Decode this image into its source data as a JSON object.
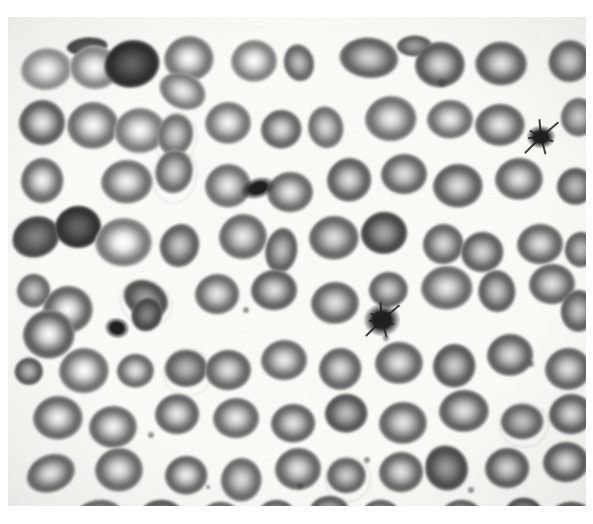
{
  "image": {
    "kind": "photomicrograph",
    "subject": "peripheral blood smear",
    "modality": "brightfield light microscopy",
    "color_mode": "grayscale",
    "width_px": 593,
    "height_px": 524,
    "background_color": "#f6f6f3",
    "paper_margin_color": "#ffffff",
    "cell_ring_color": "#5d5d5d",
    "cell_dark_color": "#2c2c2c",
    "cell_pallor_color": "#efefec",
    "platelet_color": "#262626"
  },
  "field": {
    "left": 8,
    "top": 17,
    "width": 578,
    "height": 489
  },
  "objects": {
    "erythrocytes": [
      {
        "x": 12,
        "y": 30,
        "w": 58,
        "h": 52,
        "rot": -6,
        "tone": 0.58,
        "pallor": 0.62,
        "shape": "discocyte"
      },
      {
        "x": 58,
        "y": 20,
        "w": 46,
        "h": 22,
        "rot": -4,
        "tone": 0.3,
        "pallor": 0.1,
        "shape": "edge-clip"
      },
      {
        "x": 60,
        "y": 28,
        "w": 56,
        "h": 54,
        "rot": 8,
        "tone": 0.55,
        "pallor": 0.66,
        "shape": "discocyte"
      },
      {
        "x": 96,
        "y": 22,
        "w": 62,
        "h": 58,
        "rot": -10,
        "tone": 0.2,
        "pallor": 0.3,
        "shape": "dense"
      },
      {
        "x": 155,
        "y": 18,
        "w": 56,
        "h": 56,
        "rot": 0,
        "tone": 0.48,
        "pallor": 0.74,
        "shape": "discocyte"
      },
      {
        "x": 148,
        "y": 56,
        "w": 54,
        "h": 44,
        "rot": 24,
        "tone": 0.5,
        "pallor": 0.62,
        "shape": "ovalocyte"
      },
      {
        "x": 222,
        "y": 22,
        "w": 52,
        "h": 52,
        "rot": 0,
        "tone": 0.52,
        "pallor": 0.7,
        "shape": "discocyte"
      },
      {
        "x": 276,
        "y": 26,
        "w": 34,
        "h": 46,
        "rot": -14,
        "tone": 0.42,
        "pallor": 0.5,
        "shape": "edge-clip"
      },
      {
        "x": 330,
        "y": 20,
        "w": 66,
        "h": 50,
        "rot": 6,
        "tone": 0.4,
        "pallor": 0.64,
        "shape": "discocyte"
      },
      {
        "x": 388,
        "y": 18,
        "w": 40,
        "h": 26,
        "rot": 0,
        "tone": 0.4,
        "pallor": 0.35,
        "shape": "edge-clip"
      },
      {
        "x": 406,
        "y": 24,
        "w": 56,
        "h": 56,
        "rot": 0,
        "tone": 0.38,
        "pallor": 0.72,
        "shape": "discocyte"
      },
      {
        "x": 466,
        "y": 24,
        "w": 58,
        "h": 54,
        "rot": 4,
        "tone": 0.4,
        "pallor": 0.74,
        "shape": "discocyte"
      },
      {
        "x": 540,
        "y": 22,
        "w": 48,
        "h": 52,
        "rot": -8,
        "tone": 0.42,
        "pallor": 0.6,
        "shape": "discocyte"
      },
      {
        "x": 10,
        "y": 82,
        "w": 52,
        "h": 56,
        "rot": 0,
        "tone": 0.4,
        "pallor": 0.78,
        "shape": "discocyte"
      },
      {
        "x": 58,
        "y": 84,
        "w": 58,
        "h": 58,
        "rot": 0,
        "tone": 0.46,
        "pallor": 0.76,
        "shape": "discocyte"
      },
      {
        "x": 105,
        "y": 90,
        "w": 58,
        "h": 56,
        "rot": 0,
        "tone": 0.5,
        "pallor": 0.7,
        "shape": "discocyte"
      },
      {
        "x": 148,
        "y": 96,
        "w": 40,
        "h": 52,
        "rot": 12,
        "tone": 0.46,
        "pallor": 0.52,
        "shape": "echinocyte"
      },
      {
        "x": 196,
        "y": 84,
        "w": 52,
        "h": 52,
        "rot": 0,
        "tone": 0.48,
        "pallor": 0.7,
        "shape": "discocyte"
      },
      {
        "x": 252,
        "y": 92,
        "w": 46,
        "h": 48,
        "rot": 0,
        "tone": 0.42,
        "pallor": 0.66,
        "shape": "discocyte"
      },
      {
        "x": 300,
        "y": 88,
        "w": 40,
        "h": 52,
        "rot": -12,
        "tone": 0.46,
        "pallor": 0.58,
        "shape": "ovalocyte"
      },
      {
        "x": 356,
        "y": 78,
        "w": 58,
        "h": 56,
        "rot": 0,
        "tone": 0.46,
        "pallor": 0.7,
        "shape": "discocyte"
      },
      {
        "x": 418,
        "y": 82,
        "w": 52,
        "h": 48,
        "rot": 0,
        "tone": 0.46,
        "pallor": 0.68,
        "shape": "discocyte"
      },
      {
        "x": 466,
        "y": 86,
        "w": 56,
        "h": 52,
        "rot": 0,
        "tone": 0.42,
        "pallor": 0.72,
        "shape": "discocyte"
      },
      {
        "x": 552,
        "y": 80,
        "w": 40,
        "h": 48,
        "rot": 0,
        "tone": 0.46,
        "pallor": 0.5,
        "shape": "edge-clip"
      },
      {
        "x": 12,
        "y": 140,
        "w": 48,
        "h": 56,
        "rot": 0,
        "tone": 0.44,
        "pallor": 0.76,
        "shape": "discocyte"
      },
      {
        "x": 92,
        "y": 142,
        "w": 58,
        "h": 54,
        "rot": 0,
        "tone": 0.46,
        "pallor": 0.72,
        "shape": "discocyte"
      },
      {
        "x": 146,
        "y": 132,
        "w": 42,
        "h": 54,
        "rot": 10,
        "tone": 0.44,
        "pallor": 0.56,
        "shape": "echinocyte"
      },
      {
        "x": 196,
        "y": 146,
        "w": 52,
        "h": 54,
        "rot": 0,
        "tone": 0.46,
        "pallor": 0.68,
        "shape": "discocyte"
      },
      {
        "x": 258,
        "y": 154,
        "w": 52,
        "h": 50,
        "rot": 0,
        "tone": 0.44,
        "pallor": 0.7,
        "shape": "discocyte"
      },
      {
        "x": 318,
        "y": 140,
        "w": 50,
        "h": 54,
        "rot": 0,
        "tone": 0.4,
        "pallor": 0.7,
        "shape": "discocyte"
      },
      {
        "x": 372,
        "y": 136,
        "w": 52,
        "h": 50,
        "rot": 0,
        "tone": 0.42,
        "pallor": 0.66,
        "shape": "discocyte"
      },
      {
        "x": 424,
        "y": 146,
        "w": 56,
        "h": 54,
        "rot": 0,
        "tone": 0.4,
        "pallor": 0.7,
        "shape": "discocyte"
      },
      {
        "x": 486,
        "y": 140,
        "w": 54,
        "h": 52,
        "rot": 0,
        "tone": 0.42,
        "pallor": 0.7,
        "shape": "discocyte"
      },
      {
        "x": 548,
        "y": 150,
        "w": 42,
        "h": 46,
        "rot": 0,
        "tone": 0.4,
        "pallor": 0.52,
        "shape": "edge-clip"
      },
      {
        "x": 4,
        "y": 198,
        "w": 54,
        "h": 50,
        "rot": -18,
        "tone": 0.3,
        "pallor": 0.32,
        "shape": "dense"
      },
      {
        "x": 46,
        "y": 188,
        "w": 52,
        "h": 52,
        "rot": 0,
        "tone": 0.22,
        "pallor": 0.28,
        "shape": "dense"
      },
      {
        "x": 86,
        "y": 200,
        "w": 64,
        "h": 60,
        "rot": 0,
        "tone": 0.5,
        "pallor": 0.82,
        "shape": "discocyte"
      },
      {
        "x": 150,
        "y": 206,
        "w": 44,
        "h": 54,
        "rot": 16,
        "tone": 0.4,
        "pallor": 0.58,
        "shape": "ovalocyte"
      },
      {
        "x": 210,
        "y": 196,
        "w": 54,
        "h": 56,
        "rot": 0,
        "tone": 0.44,
        "pallor": 0.7,
        "shape": "discocyte"
      },
      {
        "x": 256,
        "y": 210,
        "w": 36,
        "h": 56,
        "rot": 8,
        "tone": 0.4,
        "pallor": 0.52,
        "shape": "ovalocyte"
      },
      {
        "x": 300,
        "y": 198,
        "w": 56,
        "h": 54,
        "rot": 0,
        "tone": 0.42,
        "pallor": 0.66,
        "shape": "discocyte"
      },
      {
        "x": 352,
        "y": 194,
        "w": 52,
        "h": 52,
        "rot": 0,
        "tone": 0.3,
        "pallor": 0.52,
        "shape": "dense"
      },
      {
        "x": 414,
        "y": 206,
        "w": 46,
        "h": 50,
        "rot": 0,
        "tone": 0.42,
        "pallor": 0.62,
        "shape": "discocyte"
      },
      {
        "x": 452,
        "y": 214,
        "w": 48,
        "h": 50,
        "rot": 0,
        "tone": 0.4,
        "pallor": 0.64,
        "shape": "discocyte"
      },
      {
        "x": 508,
        "y": 206,
        "w": 52,
        "h": 50,
        "rot": 0,
        "tone": 0.42,
        "pallor": 0.68,
        "shape": "discocyte"
      },
      {
        "x": 556,
        "y": 214,
        "w": 36,
        "h": 44,
        "rot": 0,
        "tone": 0.42,
        "pallor": 0.5,
        "shape": "edge-clip"
      },
      {
        "x": 8,
        "y": 256,
        "w": 38,
        "h": 42,
        "rot": 0,
        "tone": 0.44,
        "pallor": 0.48,
        "shape": "edge-clip"
      },
      {
        "x": 34,
        "y": 268,
        "w": 56,
        "h": 58,
        "rot": 0,
        "tone": 0.42,
        "pallor": 0.82,
        "shape": "discocyte"
      },
      {
        "x": 112,
        "y": 264,
        "w": 52,
        "h": 44,
        "rot": 28,
        "tone": 0.34,
        "pallor": 0.46,
        "shape": "echinocyte"
      },
      {
        "x": 122,
        "y": 280,
        "w": 34,
        "h": 42,
        "rot": 20,
        "tone": 0.3,
        "pallor": 0.34,
        "shape": "dense"
      },
      {
        "x": 186,
        "y": 256,
        "w": 50,
        "h": 50,
        "rot": 0,
        "tone": 0.44,
        "pallor": 0.68,
        "shape": "discocyte"
      },
      {
        "x": 242,
        "y": 252,
        "w": 52,
        "h": 50,
        "rot": 0,
        "tone": 0.4,
        "pallor": 0.7,
        "shape": "discocyte"
      },
      {
        "x": 302,
        "y": 264,
        "w": 54,
        "h": 52,
        "rot": 0,
        "tone": 0.42,
        "pallor": 0.68,
        "shape": "discocyte"
      },
      {
        "x": 360,
        "y": 254,
        "w": 44,
        "h": 44,
        "rot": 0,
        "tone": 0.42,
        "pallor": 0.58,
        "shape": "discocyte"
      },
      {
        "x": 412,
        "y": 248,
        "w": 58,
        "h": 54,
        "rot": 0,
        "tone": 0.44,
        "pallor": 0.7,
        "shape": "discocyte"
      },
      {
        "x": 470,
        "y": 252,
        "w": 42,
        "h": 52,
        "rot": -8,
        "tone": 0.4,
        "pallor": 0.58,
        "shape": "ovalocyte"
      },
      {
        "x": 520,
        "y": 246,
        "w": 52,
        "h": 50,
        "rot": 0,
        "tone": 0.42,
        "pallor": 0.68,
        "shape": "discocyte"
      },
      {
        "x": 552,
        "y": 272,
        "w": 40,
        "h": 52,
        "rot": 0,
        "tone": 0.4,
        "pallor": 0.56,
        "shape": "edge-clip"
      },
      {
        "x": 14,
        "y": 292,
        "w": 58,
        "h": 60,
        "rot": 0,
        "tone": 0.4,
        "pallor": 0.86,
        "shape": "discocyte"
      },
      {
        "x": 6,
        "y": 340,
        "w": 32,
        "h": 34,
        "rot": 0,
        "tone": 0.38,
        "pallor": 0.52,
        "shape": "edge-clip"
      },
      {
        "x": 50,
        "y": 330,
        "w": 56,
        "h": 56,
        "rot": 0,
        "tone": 0.46,
        "pallor": 0.8,
        "shape": "discocyte"
      },
      {
        "x": 108,
        "y": 336,
        "w": 42,
        "h": 42,
        "rot": 0,
        "tone": 0.44,
        "pallor": 0.66,
        "shape": "discocyte"
      },
      {
        "x": 156,
        "y": 332,
        "w": 48,
        "h": 46,
        "rot": 0,
        "tone": 0.4,
        "pallor": 0.48,
        "shape": "echinocyte"
      },
      {
        "x": 196,
        "y": 332,
        "w": 52,
        "h": 50,
        "rot": 0,
        "tone": 0.42,
        "pallor": 0.68,
        "shape": "discocyte"
      },
      {
        "x": 252,
        "y": 322,
        "w": 52,
        "h": 50,
        "rot": 0,
        "tone": 0.44,
        "pallor": 0.7,
        "shape": "discocyte"
      },
      {
        "x": 310,
        "y": 330,
        "w": 48,
        "h": 52,
        "rot": 0,
        "tone": 0.42,
        "pallor": 0.66,
        "shape": "discocyte"
      },
      {
        "x": 366,
        "y": 324,
        "w": 54,
        "h": 52,
        "rot": 0,
        "tone": 0.42,
        "pallor": 0.7,
        "shape": "discocyte"
      },
      {
        "x": 424,
        "y": 326,
        "w": 48,
        "h": 54,
        "rot": 0,
        "tone": 0.38,
        "pallor": 0.62,
        "shape": "ovalocyte"
      },
      {
        "x": 478,
        "y": 316,
        "w": 52,
        "h": 52,
        "rot": 0,
        "tone": 0.4,
        "pallor": 0.68,
        "shape": "discocyte"
      },
      {
        "x": 536,
        "y": 330,
        "w": 52,
        "h": 52,
        "rot": 0,
        "tone": 0.42,
        "pallor": 0.7,
        "shape": "discocyte"
      },
      {
        "x": 24,
        "y": 378,
        "w": 56,
        "h": 54,
        "rot": 0,
        "tone": 0.44,
        "pallor": 0.78,
        "shape": "discocyte"
      },
      {
        "x": 80,
        "y": 388,
        "w": 54,
        "h": 52,
        "rot": 0,
        "tone": 0.44,
        "pallor": 0.76,
        "shape": "discocyte"
      },
      {
        "x": 146,
        "y": 376,
        "w": 50,
        "h": 50,
        "rot": 0,
        "tone": 0.42,
        "pallor": 0.72,
        "shape": "discocyte"
      },
      {
        "x": 204,
        "y": 380,
        "w": 52,
        "h": 50,
        "rot": 0,
        "tone": 0.44,
        "pallor": 0.7,
        "shape": "discocyte"
      },
      {
        "x": 262,
        "y": 386,
        "w": 50,
        "h": 48,
        "rot": 0,
        "tone": 0.42,
        "pallor": 0.68,
        "shape": "discocyte"
      },
      {
        "x": 316,
        "y": 376,
        "w": 48,
        "h": 48,
        "rot": 0,
        "tone": 0.36,
        "pallor": 0.56,
        "shape": "discocyte"
      },
      {
        "x": 370,
        "y": 384,
        "w": 54,
        "h": 52,
        "rot": 0,
        "tone": 0.42,
        "pallor": 0.7,
        "shape": "discocyte"
      },
      {
        "x": 430,
        "y": 372,
        "w": 56,
        "h": 52,
        "rot": 0,
        "tone": 0.4,
        "pallor": 0.72,
        "shape": "discocyte"
      },
      {
        "x": 492,
        "y": 386,
        "w": 48,
        "h": 44,
        "rot": 0,
        "tone": 0.42,
        "pallor": 0.52,
        "shape": "echinocyte"
      },
      {
        "x": 540,
        "y": 376,
        "w": 50,
        "h": 50,
        "rot": 0,
        "tone": 0.4,
        "pallor": 0.7,
        "shape": "discocyte"
      },
      {
        "x": 18,
        "y": 436,
        "w": 56,
        "h": 46,
        "rot": -20,
        "tone": 0.44,
        "pallor": 0.72,
        "shape": "ovalocyte"
      },
      {
        "x": 86,
        "y": 430,
        "w": 54,
        "h": 54,
        "rot": 0,
        "tone": 0.44,
        "pallor": 0.74,
        "shape": "discocyte"
      },
      {
        "x": 156,
        "y": 438,
        "w": 48,
        "h": 48,
        "rot": 0,
        "tone": 0.42,
        "pallor": 0.76,
        "shape": "discocyte"
      },
      {
        "x": 212,
        "y": 440,
        "w": 46,
        "h": 54,
        "rot": 0,
        "tone": 0.44,
        "pallor": 0.62,
        "shape": "discocyte"
      },
      {
        "x": 266,
        "y": 430,
        "w": 52,
        "h": 52,
        "rot": 0,
        "tone": 0.42,
        "pallor": 0.7,
        "shape": "discocyte"
      },
      {
        "x": 318,
        "y": 440,
        "w": 44,
        "h": 44,
        "rot": 0,
        "tone": 0.42,
        "pallor": 0.56,
        "shape": "echinocyte"
      },
      {
        "x": 370,
        "y": 434,
        "w": 50,
        "h": 50,
        "rot": 0,
        "tone": 0.42,
        "pallor": 0.7,
        "shape": "discocyte"
      },
      {
        "x": 418,
        "y": 426,
        "w": 48,
        "h": 56,
        "rot": -28,
        "tone": 0.32,
        "pallor": 0.44,
        "shape": "ovalocyte"
      },
      {
        "x": 476,
        "y": 430,
        "w": 50,
        "h": 50,
        "rot": 0,
        "tone": 0.4,
        "pallor": 0.68,
        "shape": "discocyte"
      },
      {
        "x": 534,
        "y": 424,
        "w": 52,
        "h": 50,
        "rot": 0,
        "tone": 0.4,
        "pallor": 0.72,
        "shape": "discocyte"
      },
      {
        "x": 64,
        "y": 482,
        "w": 56,
        "h": 40,
        "rot": -10,
        "tone": 0.44,
        "pallor": 0.66,
        "shape": "edge-clip"
      },
      {
        "x": 130,
        "y": 482,
        "w": 50,
        "h": 40,
        "rot": 0,
        "tone": 0.38,
        "pallor": 0.54,
        "shape": "edge-clip"
      },
      {
        "x": 192,
        "y": 484,
        "w": 44,
        "h": 36,
        "rot": 0,
        "tone": 0.44,
        "pallor": 0.7,
        "shape": "edge-clip"
      },
      {
        "x": 248,
        "y": 482,
        "w": 44,
        "h": 40,
        "rot": 0,
        "tone": 0.42,
        "pallor": 0.6,
        "shape": "edge-clip"
      },
      {
        "x": 300,
        "y": 478,
        "w": 46,
        "h": 40,
        "rot": 0,
        "tone": 0.4,
        "pallor": 0.58,
        "shape": "edge-clip"
      },
      {
        "x": 352,
        "y": 482,
        "w": 44,
        "h": 38,
        "rot": 0,
        "tone": 0.42,
        "pallor": 0.62,
        "shape": "edge-clip"
      },
      {
        "x": 432,
        "y": 482,
        "w": 46,
        "h": 38,
        "rot": 0,
        "tone": 0.42,
        "pallor": 0.68,
        "shape": "edge-clip"
      },
      {
        "x": 496,
        "y": 480,
        "w": 42,
        "h": 36,
        "rot": 0,
        "tone": 0.36,
        "pallor": 0.46,
        "shape": "edge-clip"
      },
      {
        "x": 540,
        "y": 484,
        "w": 50,
        "h": 38,
        "rot": 0,
        "tone": 0.4,
        "pallor": 0.62,
        "shape": "edge-clip"
      }
    ],
    "platelets": [
      {
        "x": 232,
        "y": 160,
        "w": 36,
        "h": 22,
        "rot": -18,
        "label": "platelet-upper-center"
      },
      {
        "x": 355,
        "y": 286,
        "w": 38,
        "h": 34,
        "rot": 0,
        "label": "platelet-spiculated-center"
      },
      {
        "x": 518,
        "y": 108,
        "w": 30,
        "h": 24,
        "rot": 0,
        "label": "platelet-spiculated-right"
      },
      {
        "x": 96,
        "y": 300,
        "w": 26,
        "h": 22,
        "rot": 12,
        "label": "platelet-left"
      },
      {
        "x": 576,
        "y": 496,
        "w": 18,
        "h": 18,
        "rot": 0,
        "label": "debris-corner"
      }
    ],
    "debris": [
      {
        "x": 430,
        "y": 62,
        "r": 4
      },
      {
        "x": 235,
        "y": 290,
        "r": 3
      },
      {
        "x": 375,
        "y": 318,
        "r": 3
      },
      {
        "x": 289,
        "y": 466,
        "r": 3
      },
      {
        "x": 520,
        "y": 344,
        "r": 3
      },
      {
        "x": 460,
        "y": 470,
        "r": 3
      },
      {
        "x": 140,
        "y": 415,
        "r": 3
      },
      {
        "x": 198,
        "y": 468,
        "r": 2
      },
      {
        "x": 356,
        "y": 440,
        "r": 3
      }
    ]
  },
  "caption": {
    "visible": false,
    "text": ""
  }
}
